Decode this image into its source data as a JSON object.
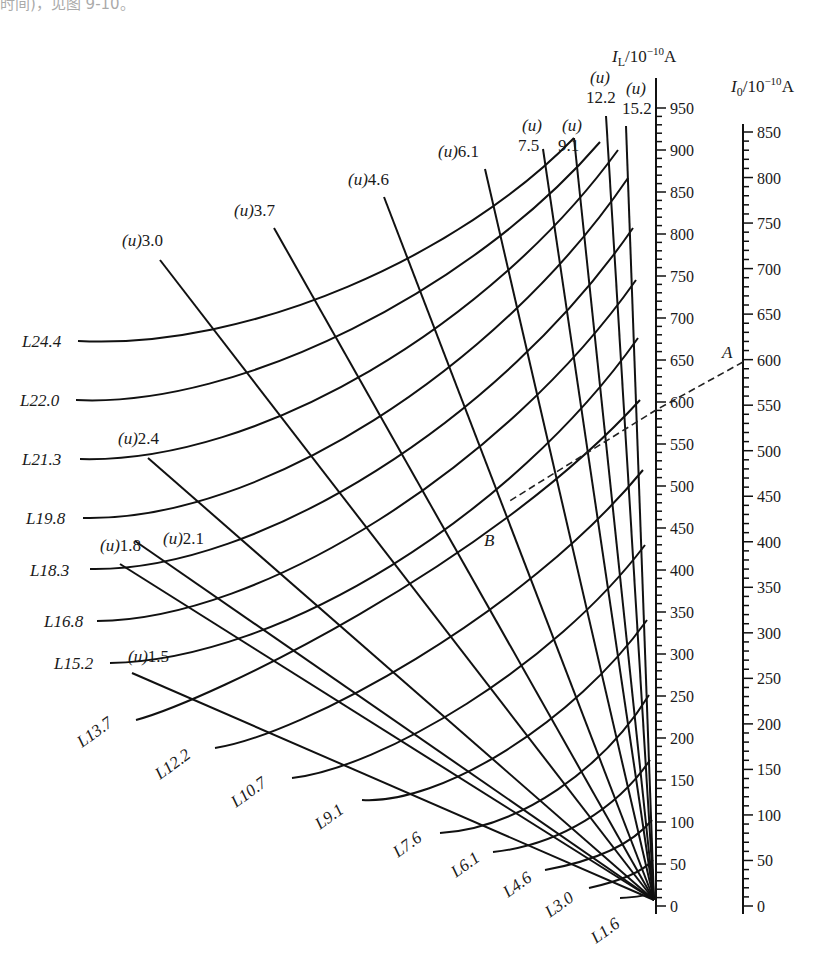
{
  "caption_fragment": "时间)，见图 9-10。",
  "axes": {
    "IL": {
      "title_sym": "I",
      "title_sub": "L",
      "title_unit": "/10",
      "title_exp": "−10",
      "title_A": "A",
      "x": 656,
      "y_zero": 906,
      "y_top_val": 950,
      "y_at_top": 108,
      "y_line_top": 78,
      "max": 950,
      "major_step": 50,
      "minor_step": 10,
      "labels": [
        "0",
        "50",
        "100",
        "150",
        "200",
        "250",
        "300",
        "350",
        "400",
        "450",
        "500",
        "550",
        "600",
        "650",
        "700",
        "750",
        "800",
        "850",
        "900",
        "950"
      ]
    },
    "I0": {
      "title_sym": "I",
      "title_sub": "0",
      "title_unit": "/10",
      "title_exp": "−10",
      "title_A": "A",
      "x": 743,
      "y_zero": 906,
      "y_top_val": 850,
      "y_at_top": 132,
      "y_line_top": 124,
      "max": 850,
      "major_step": 50,
      "minor_step": 10,
      "labels": [
        "0",
        "50",
        "100",
        "150",
        "200",
        "250",
        "300",
        "350",
        "400",
        "450",
        "500",
        "550",
        "600",
        "650",
        "700",
        "750",
        "800",
        "850"
      ]
    }
  },
  "convergence": {
    "x": 654,
    "y": 900
  },
  "u_lines": [
    {
      "label": "1.5",
      "prefix": "(u)",
      "top": [
        132,
        673
      ],
      "lx": 128,
      "ly": 662,
      "stacked": false
    },
    {
      "label": "1.8",
      "prefix": "(u)",
      "top": [
        120,
        564
      ],
      "lx": 100,
      "ly": 551,
      "stacked": false
    },
    {
      "label": "2.1",
      "prefix": "(u)",
      "top": [
        135,
        541
      ],
      "lx": 163,
      "ly": 544,
      "stacked": false
    },
    {
      "label": "2.4",
      "prefix": "(u)",
      "top": [
        148,
        458
      ],
      "lx": 118,
      "ly": 444,
      "stacked": false
    },
    {
      "label": "3.0",
      "prefix": "(u)",
      "top": [
        160,
        260
      ],
      "lx": 122,
      "ly": 246,
      "stacked": false
    },
    {
      "label": "3.7",
      "prefix": "(u)",
      "top": [
        274,
        228
      ],
      "lx": 234,
      "ly": 216,
      "stacked": false
    },
    {
      "label": "4.6",
      "prefix": "(u)",
      "top": [
        384,
        197
      ],
      "lx": 348,
      "ly": 185,
      "stacked": false
    },
    {
      "label": "6.1",
      "prefix": "(u)",
      "top": [
        485,
        169
      ],
      "lx": 438,
      "ly": 157,
      "stacked": false
    },
    {
      "label": "7.5",
      "prefix": "(u)",
      "top": [
        543,
        149
      ],
      "lx": 518,
      "ly": 131,
      "stacked": true
    },
    {
      "label": "9.1",
      "prefix": "(u)",
      "top": [
        574,
        138
      ],
      "lx": 558,
      "ly": 131,
      "stacked": true
    },
    {
      "label": "12.2",
      "prefix": "(u)",
      "top": [
        606,
        116
      ],
      "lx": 586,
      "ly": 83,
      "stacked": true
    },
    {
      "label": "15.2",
      "prefix": "(u)",
      "top": [
        626,
        126
      ],
      "lx": 622,
      "ly": 94,
      "stacked": true
    }
  ],
  "L_curves": [
    {
      "label": "L24.4",
      "start": [
        78,
        341
      ],
      "mid": [
        250,
        350
      ],
      "end": [
        574,
        138
      ],
      "lx": 22,
      "ly": 347,
      "rot": 0
    },
    {
      "label": "L22.0",
      "start": [
        76,
        400
      ],
      "mid": [
        240,
        408
      ],
      "end": [
        600,
        142
      ],
      "lx": 20,
      "ly": 406,
      "rot": 0
    },
    {
      "label": "L21.3",
      "start": [
        80,
        459
      ],
      "mid": [
        260,
        464
      ],
      "end": [
        618,
        150
      ],
      "lx": 22,
      "ly": 465,
      "rot": 0
    },
    {
      "label": "L19.8",
      "start": [
        83,
        518
      ],
      "mid": [
        260,
        522
      ],
      "end": [
        628,
        178
      ],
      "lx": 26,
      "ly": 524,
      "rot": 0
    },
    {
      "label": "L18.3",
      "start": [
        90,
        569
      ],
      "mid": [
        260,
        572
      ],
      "end": [
        633,
        228
      ],
      "lx": 30,
      "ly": 576,
      "rot": 0
    },
    {
      "label": "L16.8",
      "start": [
        97,
        621
      ],
      "mid": [
        260,
        620
      ],
      "end": [
        636,
        280
      ],
      "lx": 44,
      "ly": 627,
      "rot": 0
    },
    {
      "label": "L15.2",
      "start": [
        110,
        663
      ],
      "mid": [
        280,
        660
      ],
      "end": [
        638,
        338
      ],
      "lx": 54,
      "ly": 669,
      "rot": 0
    },
    {
      "label": "L13.7",
      "start": [
        136,
        720
      ],
      "mid": [
        210,
        700
      ],
      "end": [
        640,
        400
      ],
      "lx": 82,
      "ly": 748,
      "rot": -36
    },
    {
      "label": "L12.2",
      "start": [
        215,
        748
      ],
      "mid": [
        300,
        735
      ],
      "end": [
        643,
        470
      ],
      "lx": 160,
      "ly": 780,
      "rot": -36
    },
    {
      "label": "L10.7",
      "start": [
        292,
        778
      ],
      "mid": [
        380,
        768
      ],
      "end": [
        645,
        545
      ],
      "lx": 236,
      "ly": 808,
      "rot": -36
    },
    {
      "label": "L9.1",
      "start": [
        362,
        800
      ],
      "mid": [
        440,
        805
      ],
      "end": [
        647,
        620
      ],
      "lx": 320,
      "ly": 830,
      "rot": -36
    },
    {
      "label": "L7.6",
      "start": [
        440,
        833
      ],
      "mid": [
        520,
        828
      ],
      "end": [
        649,
        695
      ],
      "lx": 398,
      "ly": 858,
      "rot": -36
    },
    {
      "label": "L6.1",
      "start": [
        493,
        852
      ],
      "mid": [
        560,
        845
      ],
      "end": [
        650,
        760
      ],
      "lx": 456,
      "ly": 878,
      "rot": -36
    },
    {
      "label": "L4.6",
      "start": [
        545,
        870
      ],
      "mid": [
        600,
        860
      ],
      "end": [
        652,
        820
      ],
      "lx": 508,
      "ly": 898,
      "rot": -36
    },
    {
      "label": "L3.0",
      "start": [
        589,
        888
      ],
      "mid": [
        625,
        880
      ],
      "end": [
        653,
        860
      ],
      "lx": 550,
      "ly": 918,
      "rot": -36
    },
    {
      "label": "L1.6",
      "start": [
        620,
        898
      ],
      "mid": [
        640,
        897
      ],
      "end": [
        654,
        892
      ],
      "lx": 596,
      "ly": 944,
      "rot": -36
    }
  ],
  "example": {
    "point_A_label": "A",
    "point_B_label": "B",
    "A": [
      743,
      362
    ],
    "A_label_pos": [
      722,
      358
    ],
    "IL_cross": [
      656,
      410
    ],
    "B_curve": [
      508,
      502
    ],
    "B_label_pos": [
      484,
      546
    ],
    "IL_value": 575,
    "I0_value": 600
  }
}
